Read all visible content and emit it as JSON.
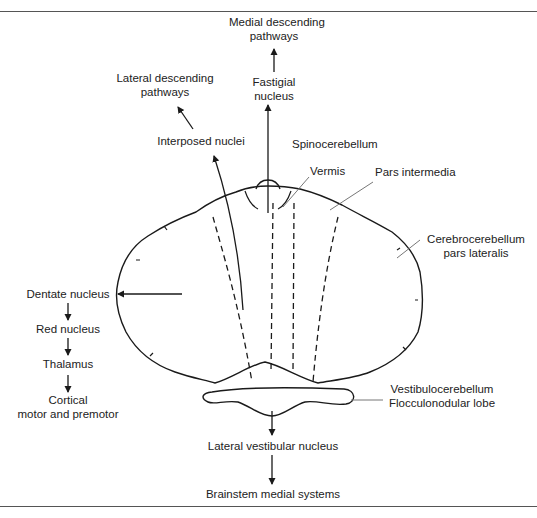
{
  "diagram": {
    "labels": {
      "medial_descending_1": "Medial descending",
      "medial_descending_2": "pathways",
      "fastigial_1": "Fastigial",
      "fastigial_2": "nucleus",
      "lateral_descending_1": "Lateral descending",
      "lateral_descending_2": "pathways",
      "interposed": "Interposed nuclei",
      "spinocerebellum": "Spinocerebellum",
      "vermis": "Vermis",
      "pars_intermedia": "Pars intermedia",
      "cerebrocerebellum_1": "Cerebrocerebellum",
      "cerebrocerebellum_2": "pars lateralis",
      "dentate": "Dentate nucleus",
      "red_nucleus": "Red nucleus",
      "thalamus": "Thalamus",
      "cortical_1": "Cortical",
      "cortical_2": "motor and premotor",
      "vestibulocerebellum_1": "Vestibulocerebellum",
      "vestibulocerebellum_2": "Flocculonodular lobe",
      "lateral_vestibular": "Lateral vestibular nucleus",
      "brainstem": "Brainstem medial systems"
    },
    "colors": {
      "line": "#1a1a1a",
      "leader": "#777777",
      "rule": "#555555"
    }
  }
}
